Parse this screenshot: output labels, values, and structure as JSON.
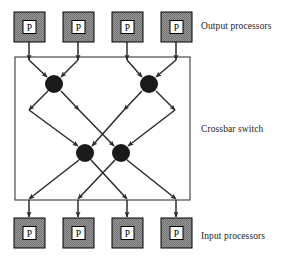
{
  "diagram": {
    "type": "block-diagram",
    "canvas": {
      "width": 292,
      "height": 263
    },
    "colors": {
      "processor_fill": "#8c8c8c",
      "processor_stroke": "#000000",
      "processor_inner_fill": "#ffffff",
      "node_fill": "#1a1a1a",
      "line": "#2b2b2b",
      "box_stroke": "#4a4a4a",
      "background": "#ffffff",
      "text": "#1c1c1c"
    },
    "labels": {
      "output": "Output processors",
      "crossbar": "Crossbar switch",
      "input": "Input processors"
    },
    "processor_label": "P",
    "output_processors": [
      {
        "id": "out-0",
        "label": "P",
        "x": 14,
        "y": 12,
        "w": 31,
        "h": 30
      },
      {
        "id": "out-1",
        "label": "P",
        "x": 63,
        "y": 12,
        "w": 31,
        "h": 30
      },
      {
        "id": "out-2",
        "label": "P",
        "x": 112,
        "y": 12,
        "w": 31,
        "h": 30
      },
      {
        "id": "out-3",
        "label": "P",
        "x": 161,
        "y": 12,
        "w": 31,
        "h": 30
      }
    ],
    "input_processors": [
      {
        "id": "in-0",
        "label": "P",
        "x": 14,
        "y": 218,
        "w": 31,
        "h": 30
      },
      {
        "id": "in-1",
        "label": "P",
        "x": 63,
        "y": 218,
        "w": 31,
        "h": 30
      },
      {
        "id": "in-2",
        "label": "P",
        "x": 112,
        "y": 218,
        "w": 31,
        "h": 30
      },
      {
        "id": "in-3",
        "label": "P",
        "x": 161,
        "y": 218,
        "w": 31,
        "h": 30
      }
    ],
    "switch_box": {
      "x": 15,
      "y": 57,
      "w": 175,
      "h": 143
    },
    "switch_nodes": [
      {
        "id": "node-top-left",
        "cx": 54,
        "cy": 84,
        "r": 9
      },
      {
        "id": "node-top-right",
        "cx": 149,
        "cy": 84,
        "r": 9
      },
      {
        "id": "node-bottom-left",
        "cx": 85,
        "cy": 153,
        "r": 9
      },
      {
        "id": "node-bottom-right",
        "cx": 121,
        "cy": 153,
        "r": 9
      }
    ],
    "vertical_feeds_top": [
      {
        "id": "feed-top-0",
        "x": 29,
        "y1": 42,
        "y2": 60
      },
      {
        "id": "feed-top-1",
        "x": 78,
        "y1": 42,
        "y2": 60
      },
      {
        "id": "feed-top-2",
        "x": 127,
        "y1": 42,
        "y2": 60
      },
      {
        "id": "feed-top-3",
        "x": 176,
        "y1": 42,
        "y2": 60
      }
    ],
    "vertical_feeds_bottom": [
      {
        "id": "feed-bot-0",
        "x": 29,
        "y1": 200,
        "y2": 217
      },
      {
        "id": "feed-bot-1",
        "x": 78,
        "y1": 200,
        "y2": 217
      },
      {
        "id": "feed-bot-2",
        "x": 127,
        "y1": 200,
        "y2": 217
      },
      {
        "id": "feed-bot-3",
        "x": 176,
        "y1": 200,
        "y2": 217
      }
    ],
    "edges_into_top_nodes": [
      {
        "id": "e-in-0",
        "x1": 29,
        "y1": 60,
        "x2": 47,
        "y2": 77
      },
      {
        "id": "e-in-1",
        "x1": 78,
        "y1": 60,
        "x2": 61,
        "y2": 77
      },
      {
        "id": "e-in-2",
        "x1": 127,
        "y1": 60,
        "x2": 142,
        "y2": 77
      },
      {
        "id": "e-in-3",
        "x1": 176,
        "y1": 60,
        "x2": 156,
        "y2": 77
      }
    ],
    "edges_from_top_nodes": [
      {
        "id": "e-mid-0",
        "x1": 48,
        "y1": 91,
        "x2": 29,
        "y2": 110
      },
      {
        "id": "e-mid-1",
        "x1": 61,
        "y1": 91,
        "x2": 79,
        "y2": 110
      },
      {
        "id": "e-mid-2",
        "x1": 142,
        "y1": 91,
        "x2": 124,
        "y2": 110
      },
      {
        "id": "e-mid-3",
        "x1": 156,
        "y1": 91,
        "x2": 175,
        "y2": 110
      }
    ],
    "edges_into_bottom_nodes": [
      {
        "id": "e-low-0",
        "x1": 29,
        "y1": 110,
        "x2": 78,
        "y2": 146
      },
      {
        "id": "e-low-1",
        "x1": 124,
        "y1": 110,
        "x2": 92,
        "y2": 146
      },
      {
        "id": "e-low-2",
        "x1": 79,
        "y1": 110,
        "x2": 114,
        "y2": 146
      },
      {
        "id": "e-low-3",
        "x1": 175,
        "y1": 110,
        "x2": 128,
        "y2": 146
      }
    ],
    "edges_from_bottom_nodes": [
      {
        "id": "e-out-0",
        "x1": 79,
        "y1": 160,
        "x2": 29,
        "y2": 199
      },
      {
        "id": "e-out-1",
        "x1": 91,
        "y1": 160,
        "x2": 127,
        "y2": 199
      },
      {
        "id": "e-out-2",
        "x1": 115,
        "y1": 160,
        "x2": 78,
        "y2": 199
      },
      {
        "id": "e-out-3",
        "x1": 127,
        "y1": 160,
        "x2": 176,
        "y2": 199
      }
    ]
  }
}
